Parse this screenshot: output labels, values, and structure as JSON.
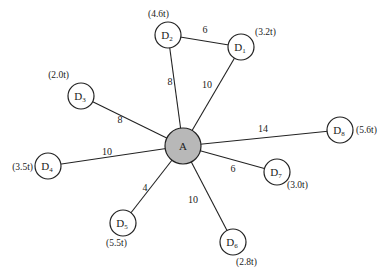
{
  "diagram": {
    "type": "star-network",
    "hub": {
      "id": "A",
      "label": "A",
      "x": 183,
      "y": 146,
      "r": 18,
      "fill": "#b8b8b8"
    },
    "nodes": [
      {
        "id": "D1",
        "base": "D",
        "sub": "1",
        "demand": "(3.2t)",
        "x": 241,
        "y": 47,
        "dx": 14,
        "dy": -12,
        "anchor": "start"
      },
      {
        "id": "D2",
        "base": "D",
        "sub": "2",
        "demand": "(4.6t)",
        "x": 168,
        "y": 35,
        "dx": -20,
        "dy": -18,
        "anchor": "start"
      },
      {
        "id": "D3",
        "base": "D",
        "sub": "3",
        "demand": "(2.0t)",
        "x": 81,
        "y": 96,
        "dx": -12,
        "dy": -18,
        "anchor": "end"
      },
      {
        "id": "D4",
        "base": "D",
        "sub": "4",
        "demand": "(3.5t)",
        "x": 48,
        "y": 166,
        "dx": -15,
        "dy": 4,
        "anchor": "end"
      },
      {
        "id": "D5",
        "base": "D",
        "sub": "5",
        "demand": "(5.5t)",
        "x": 123,
        "y": 223,
        "dx": -17,
        "dy": 23,
        "anchor": "start"
      },
      {
        "id": "D6",
        "base": "D",
        "sub": "6",
        "demand": "(2.8t)",
        "x": 233,
        "y": 242,
        "dx": 3,
        "dy": 23,
        "anchor": "start"
      },
      {
        "id": "D7",
        "base": "D",
        "sub": "7",
        "demand": "(3.0t)",
        "x": 277,
        "y": 172,
        "dx": 10,
        "dy": 16,
        "anchor": "start"
      },
      {
        "id": "D8",
        "base": "D",
        "sub": "8",
        "demand": "(5.6t)",
        "x": 340,
        "y": 130,
        "dx": 16,
        "dy": 3,
        "anchor": "start"
      }
    ],
    "node_radius": 13,
    "edges": [
      {
        "from": "A",
        "to": "D1",
        "weight": "10",
        "lx": 207,
        "ly": 88
      },
      {
        "from": "A",
        "to": "D2",
        "weight": "8",
        "lx": 170,
        "ly": 85
      },
      {
        "from": "D2",
        "to": "D1",
        "weight": "6",
        "lx": 205,
        "ly": 33
      },
      {
        "from": "A",
        "to": "D3",
        "weight": "8",
        "lx": 120,
        "ly": 123
      },
      {
        "from": "A",
        "to": "D4",
        "weight": "10",
        "lx": 107,
        "ly": 155
      },
      {
        "from": "A",
        "to": "D5",
        "weight": "4",
        "lx": 145,
        "ly": 191
      },
      {
        "from": "A",
        "to": "D6",
        "weight": "10",
        "lx": 193,
        "ly": 203
      },
      {
        "from": "A",
        "to": "D7",
        "weight": "6",
        "lx": 233,
        "ly": 172
      },
      {
        "from": "A",
        "to": "D8",
        "weight": "14",
        "lx": 263,
        "ly": 132
      }
    ]
  }
}
